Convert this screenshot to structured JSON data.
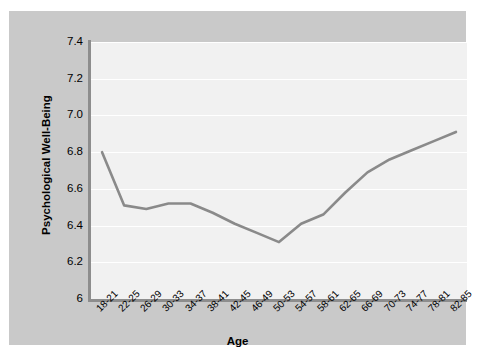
{
  "figure": {
    "background_color": "#c9c9c9",
    "plot_background_color": "#f1f1f1",
    "gridline_color": "#ffffff",
    "axis_color": "#8d8d8d",
    "line_color": "#8a8a8a"
  },
  "chart_data": {
    "type": "line",
    "title": "",
    "xlabel": "Age",
    "ylabel": "Psychological Well-Being",
    "categories": [
      "18-21",
      "22-25",
      "26-29",
      "30-33",
      "34-37",
      "38-41",
      "42-45",
      "46-49",
      "50-53",
      "54-57",
      "58-61",
      "62-65",
      "66-69",
      "70-73",
      "74-77",
      "78-81",
      "82-85"
    ],
    "values": [
      6.8,
      6.51,
      6.49,
      6.52,
      6.52,
      6.47,
      6.41,
      6.36,
      6.31,
      6.41,
      6.46,
      6.58,
      6.69,
      6.76,
      6.81,
      6.86,
      6.91
    ],
    "ylim": [
      6.0,
      7.4
    ],
    "yticks": [
      6.0,
      6.2,
      6.4,
      6.6,
      6.8,
      7.0,
      7.2,
      7.4
    ],
    "ytick_labels": [
      "6",
      "6.2",
      "6.4",
      "6.6",
      "6.8",
      "7.0",
      "7.2",
      "7.4"
    ],
    "grid": true,
    "grid_axis": "y",
    "legend": false,
    "legend_position": "none",
    "series": [
      {
        "name": "Psychological Well-Being",
        "values": [
          6.8,
          6.51,
          6.49,
          6.52,
          6.52,
          6.47,
          6.41,
          6.36,
          6.31,
          6.41,
          6.46,
          6.58,
          6.69,
          6.76,
          6.81,
          6.86,
          6.91
        ]
      }
    ]
  }
}
